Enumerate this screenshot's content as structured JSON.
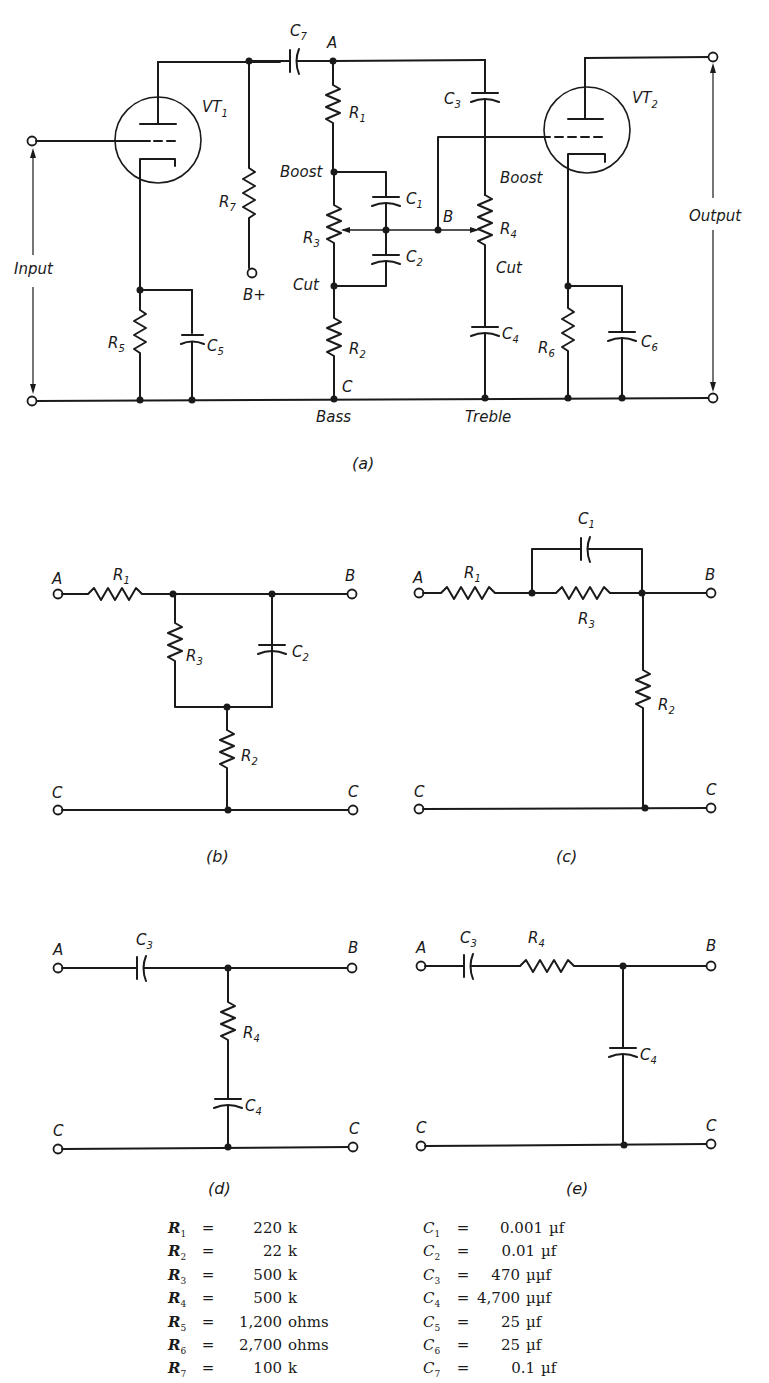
{
  "figure": {
    "subfigures": [
      {
        "id": "a",
        "caption": "(a)",
        "description": "Two-stage vacuum tube amplifier with bass and treble tone controls"
      },
      {
        "id": "b",
        "caption": "(b)",
        "description": "Bass boost equivalent network"
      },
      {
        "id": "c",
        "caption": "(c)",
        "description": "Bass cut equivalent network"
      },
      {
        "id": "d",
        "caption": "(d)",
        "description": "Treble boost equivalent network"
      },
      {
        "id": "e",
        "caption": "(e)",
        "description": "Treble cut equivalent network"
      }
    ],
    "circuit_a": {
      "tube1": "VT",
      "tube1_sub": "1",
      "tube2": "VT",
      "tube2_sub": "2",
      "input_label": "Input",
      "output_label": "Output",
      "supply_label": "B+",
      "node_a": "A",
      "node_b": "B",
      "node_c": "C",
      "boost_label": "Boost",
      "cut_label": "Cut",
      "bass_label": "Bass",
      "treble_label": "Treble",
      "components": {
        "R1": {
          "letter": "R",
          "sub": "1"
        },
        "R2": {
          "letter": "R",
          "sub": "2"
        },
        "R3": {
          "letter": "R",
          "sub": "3"
        },
        "R4": {
          "letter": "R",
          "sub": "4"
        },
        "R5": {
          "letter": "R",
          "sub": "5"
        },
        "R6": {
          "letter": "R",
          "sub": "6"
        },
        "R7": {
          "letter": "R",
          "sub": "7"
        },
        "C1": {
          "letter": "C",
          "sub": "1"
        },
        "C2": {
          "letter": "C",
          "sub": "2"
        },
        "C3": {
          "letter": "C",
          "sub": "3"
        },
        "C4": {
          "letter": "C",
          "sub": "4"
        },
        "C5": {
          "letter": "C",
          "sub": "5"
        },
        "C6": {
          "letter": "C",
          "sub": "6"
        },
        "C7": {
          "letter": "C",
          "sub": "7"
        }
      }
    },
    "terminals": {
      "a": "A",
      "b": "B",
      "c": "C"
    }
  },
  "values": {
    "resistors": [
      {
        "sym": "R",
        "sub": "1",
        "eq": "=",
        "value": "220",
        "unit": "k"
      },
      {
        "sym": "R",
        "sub": "2",
        "eq": "=",
        "value": "22",
        "unit": "k"
      },
      {
        "sym": "R",
        "sub": "3",
        "eq": "=",
        "value": "500",
        "unit": "k"
      },
      {
        "sym": "R",
        "sub": "4",
        "eq": "=",
        "value": "500",
        "unit": "k"
      },
      {
        "sym": "R",
        "sub": "5",
        "eq": "=",
        "value": "1,200",
        "unit": "ohms"
      },
      {
        "sym": "R",
        "sub": "6",
        "eq": "=",
        "value": "2,700",
        "unit": "ohms"
      },
      {
        "sym": "R",
        "sub": "7",
        "eq": "=",
        "value": "100",
        "unit": "k"
      }
    ],
    "capacitors": [
      {
        "sym": "C",
        "sub": "1",
        "eq": "=",
        "value": "0.001",
        "unit": "µf"
      },
      {
        "sym": "C",
        "sub": "2",
        "eq": "=",
        "value": "0.01",
        "unit": "µf"
      },
      {
        "sym": "C",
        "sub": "3",
        "eq": "=",
        "value": "470",
        "unit": "µµf"
      },
      {
        "sym": "C",
        "sub": "4",
        "eq": "=",
        "value": "4,700",
        "unit": "µµf"
      },
      {
        "sym": "C",
        "sub": "5",
        "eq": "=",
        "value": "25",
        "unit": "µf"
      },
      {
        "sym": "C",
        "sub": "6",
        "eq": "=",
        "value": "25",
        "unit": "µf"
      },
      {
        "sym": "C",
        "sub": "7",
        "eq": "=",
        "value": "0.1",
        "unit": "µf"
      }
    ]
  }
}
